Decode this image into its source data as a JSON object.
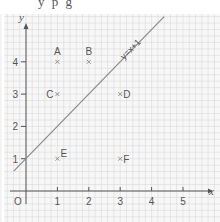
{
  "top_text": "y  p  g",
  "axes": {
    "x_label": "x",
    "y_label": "y",
    "origin_label": "O",
    "x_ticks": [
      "1",
      "2",
      "3",
      "4",
      "5"
    ],
    "y_ticks": [
      "1",
      "2",
      "3",
      "4"
    ]
  },
  "line": {
    "label": "y=x+1",
    "slope": 1,
    "intercept": 1
  },
  "points": [
    {
      "label": "A",
      "x": 1,
      "y": 4
    },
    {
      "label": "B",
      "x": 2,
      "y": 4
    },
    {
      "label": "C",
      "x": 1,
      "y": 3
    },
    {
      "label": "D",
      "x": 3,
      "y": 3
    },
    {
      "label": "E",
      "x": 1,
      "y": 1
    },
    {
      "label": "F",
      "x": 3,
      "y": 1
    }
  ],
  "colors": {
    "grid": "#d4d4d4",
    "axis": "#555555",
    "line": "#8a8a8a",
    "point": "#888888",
    "text": "#555555"
  },
  "chart_data": {
    "type": "scatter",
    "title": "",
    "xlabel": "x",
    "ylabel": "y",
    "xlim": [
      0,
      5.5
    ],
    "ylim": [
      0,
      5
    ],
    "grid": true,
    "series": [
      {
        "name": "points",
        "labels": [
          "A",
          "B",
          "C",
          "D",
          "E",
          "F"
        ],
        "x": [
          1,
          2,
          1,
          3,
          1,
          3
        ],
        "y": [
          4,
          4,
          3,
          3,
          1,
          1
        ]
      },
      {
        "name": "y=x+1",
        "type": "line",
        "x": [
          -0.2,
          4.4
        ],
        "y": [
          0.8,
          5.4
        ]
      }
    ]
  }
}
